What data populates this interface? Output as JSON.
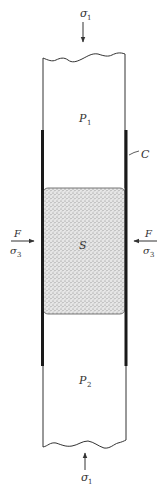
{
  "diagram": {
    "title": "",
    "colors": {
      "background": "#ffffff",
      "line": "#333333",
      "sleeve": "#1a1a1a",
      "specimen_fill": "#d9d9d9"
    },
    "labels": {
      "top_load": {
        "symbol": "σ",
        "subscript": "1"
      },
      "bottom_load": {
        "symbol": "σ",
        "subscript": "1"
      },
      "upper_piston": {
        "symbol": "P",
        "subscript": "1"
      },
      "lower_piston": {
        "symbol": "P",
        "subscript": "2"
      },
      "specimen": {
        "symbol": "S"
      },
      "sleeve": {
        "symbol": "C"
      },
      "left_fluid": {
        "force": "F",
        "stress_symbol": "σ",
        "stress_subscript": "3"
      },
      "right_fluid": {
        "force": "F",
        "stress_symbol": "σ",
        "stress_subscript": "3"
      }
    },
    "nodes": [
      {
        "id": "P1",
        "label": "P₁",
        "role": "upper piston"
      },
      {
        "id": "S",
        "label": "S",
        "role": "specimen (stippled)"
      },
      {
        "id": "P2",
        "label": "P₂",
        "role": "lower piston"
      },
      {
        "id": "C",
        "label": "C",
        "role": "jacket / sleeve"
      }
    ],
    "arrows": [
      {
        "label": "σ₁",
        "direction": "down",
        "target": "P1"
      },
      {
        "label": "σ₁",
        "direction": "up",
        "target": "P2"
      },
      {
        "label": "F / σ₃",
        "direction": "right",
        "target": "S"
      },
      {
        "label": "F / σ₃",
        "direction": "left",
        "target": "S"
      }
    ]
  }
}
